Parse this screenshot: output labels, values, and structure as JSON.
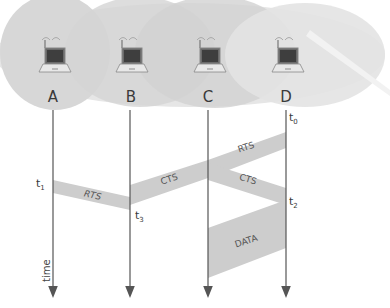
{
  "diagram": {
    "nodes": [
      {
        "id": "A",
        "label": "A"
      },
      {
        "id": "B",
        "label": "B"
      },
      {
        "id": "C",
        "label": "C"
      },
      {
        "id": "D",
        "label": "D"
      }
    ],
    "time_axis_label": "time",
    "time_markers": [
      {
        "id": "t0",
        "base": "t",
        "sub": "0",
        "node": "D"
      },
      {
        "id": "t1",
        "base": "t",
        "sub": "1",
        "node": "A"
      },
      {
        "id": "t2",
        "base": "t",
        "sub": "2",
        "node": "D"
      },
      {
        "id": "t3",
        "base": "t",
        "sub": "3",
        "node": "B"
      }
    ],
    "messages": [
      {
        "id": "rts-d-c",
        "label": "RTS",
        "from": "D",
        "to": "C"
      },
      {
        "id": "cts-c-d",
        "label": "CTS",
        "from": "C",
        "to": "D"
      },
      {
        "id": "cts-c-b",
        "label": "CTS",
        "from": "C",
        "to": "B"
      },
      {
        "id": "rts-a-b",
        "label": "RTS",
        "from": "A",
        "to": "B"
      },
      {
        "id": "data-d-c",
        "label": "DATA",
        "from": "D",
        "to": "C"
      }
    ],
    "colors": {
      "coverage": "#dcdcdc",
      "coverage_dark": "#cfcfcf",
      "band": "#cdcdcd",
      "line": "#555555"
    }
  }
}
